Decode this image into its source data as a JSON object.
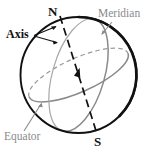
{
  "figure": {
    "background_color": "#ffffff",
    "width": 152,
    "height": 153
  },
  "labels": {
    "north_pole": "N",
    "south_pole": "S",
    "axis": "Axis",
    "meridian": "Meridian",
    "equator": "Equator"
  },
  "colors": {
    "outline": "#111111",
    "axis_line": "#111111",
    "meridian_line": "#8a8a8a",
    "equator_line": "#8a8a8a",
    "label_dark": "#111111",
    "label_gray": "#8a8a8a",
    "leader_dark": "#111111",
    "leader_gray": "#8a8a8a"
  },
  "geometry": {
    "sphere_center_x": 78.5,
    "sphere_center_y": 75,
    "sphere_radius": 58,
    "north_pole_point_x": 62,
    "north_pole_point_y": 19,
    "south_pole_point_x": 95,
    "south_pole_point_y": 131,
    "axis_style": "dashed",
    "axis_arrowhead": "center-pointing-north",
    "equator_front_style": "solid",
    "equator_back_style": "dashed",
    "meridian_style": "solid"
  },
  "annotations": [
    {
      "name": "axis",
      "text": "Axis",
      "color": "#111111",
      "leader_count": 2
    },
    {
      "name": "meridian",
      "text": "Meridian",
      "color": "#8a8a8a",
      "leader_count": 1
    },
    {
      "name": "equator",
      "text": "Equator",
      "color": "#8a8a8a",
      "leader_count": 1
    }
  ]
}
